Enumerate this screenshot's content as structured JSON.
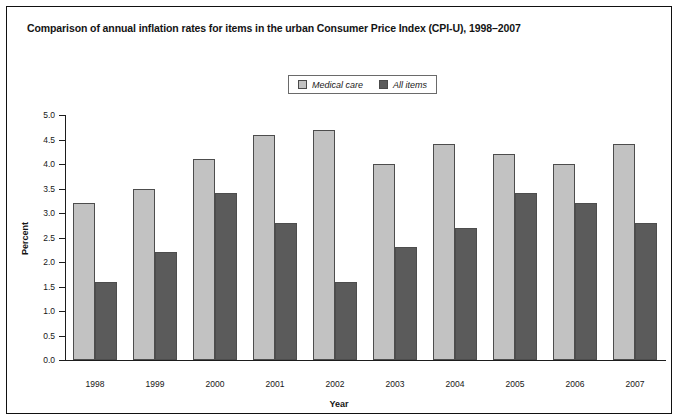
{
  "chart_data": {
    "type": "bar",
    "title": "Comparison of annual inflation rates for items in the urban Consumer Price Index (CPI-U), 1998–2007",
    "xlabel": "Year",
    "ylabel": "Percent",
    "categories": [
      "1998",
      "1999",
      "2000",
      "2001",
      "2002",
      "2003",
      "2004",
      "2005",
      "2006",
      "2007"
    ],
    "series": [
      {
        "name": "Medical care",
        "color": "#c2c2c2",
        "values": [
          3.2,
          3.5,
          4.1,
          4.6,
          4.7,
          4.0,
          4.4,
          4.2,
          4.0,
          4.4
        ]
      },
      {
        "name": "All items",
        "color": "#5b5b5b",
        "values": [
          1.6,
          2.2,
          3.4,
          2.8,
          1.6,
          2.3,
          2.7,
          3.4,
          3.2,
          2.8
        ]
      }
    ],
    "ylim": [
      0.0,
      5.0
    ],
    "ytick_labels": [
      "0.0",
      "0.5",
      "1.0",
      "1.5",
      "2.0",
      "2.5",
      "3.0",
      "3.5",
      "4.0",
      "4.5",
      "5.0"
    ],
    "ytick_values": [
      0.0,
      0.5,
      1.0,
      1.5,
      2.0,
      2.5,
      3.0,
      3.5,
      4.0,
      4.5,
      5.0
    ],
    "grid": false,
    "legend_position": "top-center",
    "legend_entries": [
      "Medical care",
      "All items"
    ]
  }
}
